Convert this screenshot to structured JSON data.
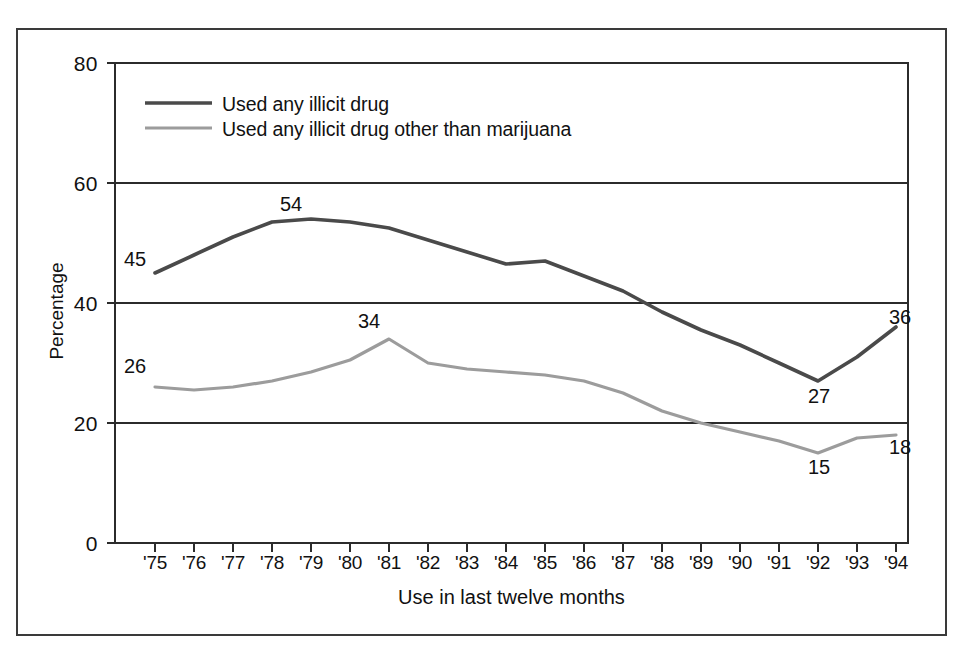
{
  "figure": {
    "border_color": "#3a3a3a"
  },
  "chart_data": {
    "type": "line",
    "title": "",
    "xlabel": "Use in last twelve months",
    "ylabel": "Percentage",
    "ylim": [
      0,
      80
    ],
    "yticks": [
      "0",
      "20",
      "40",
      "60",
      "80"
    ],
    "ytick_values": [
      0,
      20,
      40,
      60,
      80
    ],
    "grid": "horizontal",
    "legend_position": "upper-left-inside",
    "categories": [
      "'75",
      "'76",
      "'77",
      "'78",
      "'79",
      "'80",
      "'81",
      "'82",
      "'83",
      "'84",
      "'85",
      "'86",
      "'87",
      "'88",
      "'89",
      "'90",
      "'91",
      "'92",
      "'93",
      "'94"
    ],
    "series": [
      {
        "name": "Used any illicit drug",
        "color": "#4a4a4a",
        "values": [
          45,
          48,
          51,
          53.5,
          54,
          53.5,
          52.5,
          50.5,
          48.5,
          46.5,
          47,
          44.5,
          42,
          38.5,
          35.5,
          33,
          30,
          27,
          31,
          36
        ],
        "point_labels": [
          {
            "index": 0,
            "value": 45,
            "text": "45"
          },
          {
            "index": 4,
            "value": 54,
            "text": "54"
          },
          {
            "index": 17,
            "value": 27,
            "text": "27"
          },
          {
            "index": 19,
            "value": 36,
            "text": "36"
          }
        ]
      },
      {
        "name": "Used any illicit drug other than marijuana",
        "color": "#9c9c9c",
        "values": [
          26,
          25.5,
          26,
          27,
          28.5,
          30.5,
          34,
          30,
          29,
          28.5,
          28,
          27,
          25,
          22,
          20,
          18.5,
          17,
          15,
          17.5,
          18
        ],
        "point_labels": [
          {
            "index": 0,
            "value": 26,
            "text": "26"
          },
          {
            "index": 6,
            "value": 34,
            "text": "34"
          },
          {
            "index": 17,
            "value": 15,
            "text": "15"
          },
          {
            "index": 19,
            "value": 18,
            "text": "18"
          }
        ]
      }
    ],
    "legend": [
      {
        "label": "Used any illicit drug",
        "color": "#4a4a4a"
      },
      {
        "label": "Used any illicit drug other than marijuana",
        "color": "#9c9c9c"
      }
    ]
  },
  "labels": {
    "y": {
      "t0": "0",
      "t20": "20",
      "t40": "40",
      "t60": "60",
      "t80": "80",
      "title": "Percentage"
    },
    "x": {
      "y75": "'75",
      "y76": "'76",
      "y77": "'77",
      "y78": "'78",
      "y79": "'79",
      "y80": "'80",
      "y81": "'81",
      "y82": "'82",
      "y83": "'83",
      "y84": "'84",
      "y85": "'85",
      "y86": "'86",
      "y87": "'87",
      "y88": "'88",
      "y89": "'89",
      "y90": "'90",
      "y91": "'91",
      "y92": "'92",
      "y93": "'93",
      "y94": "'94",
      "title": "Use in last twelve months"
    },
    "legend": {
      "l0": "Used any illicit drug",
      "l1": "Used any illicit drug other than marijuana"
    },
    "points": {
      "dark_start": "45",
      "dark_peak": "54",
      "dark_min": "27",
      "dark_end": "36",
      "light_start": "26",
      "light_peak": "34",
      "light_min": "15",
      "light_end": "18"
    }
  }
}
